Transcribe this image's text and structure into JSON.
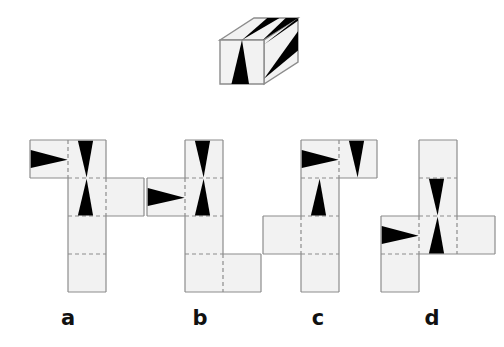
{
  "figure": {
    "type": "cube-net-puzzle",
    "background_color": "#ffffff",
    "face_fill": "#f2f2f2",
    "pattern_color": "#000000",
    "edge_color": "#8c8c8c",
    "fold_line_style": "dashed"
  },
  "cube": {
    "name": "patterned-cube",
    "faces": [
      {
        "id": "front",
        "marks": [
          "black-triangle-apex-up"
        ]
      },
      {
        "id": "top",
        "marks": [
          "black-triangle-left",
          "black-triangle-right"
        ]
      },
      {
        "id": "right",
        "marks": [
          "black-triangle-pointing-down-left"
        ]
      }
    ]
  },
  "options": [
    {
      "id": "a",
      "label": "a",
      "label_x": 68,
      "label_y": 306,
      "origin_x": 30,
      "origin_y": 140,
      "cell": 38,
      "cells": [
        {
          "col": 0,
          "row": 0,
          "marks": [
            "triangle-right"
          ]
        },
        {
          "col": 1,
          "row": 0,
          "marks": [
            "triangle-apex-down"
          ]
        },
        {
          "col": 1,
          "row": 1,
          "marks": [
            "triangle-apex-up"
          ]
        },
        {
          "col": 2,
          "row": 1,
          "marks": []
        },
        {
          "col": 1,
          "row": 2,
          "marks": []
        },
        {
          "col": 1,
          "row": 3,
          "marks": []
        }
      ]
    },
    {
      "id": "b",
      "label": "b",
      "label_x": 200,
      "label_y": 306,
      "origin_x": 147,
      "origin_y": 140,
      "cell": 38,
      "cells": [
        {
          "col": 1,
          "row": 0,
          "marks": [
            "triangle-apex-down"
          ]
        },
        {
          "col": 0,
          "row": 1,
          "marks": [
            "triangle-right"
          ]
        },
        {
          "col": 1,
          "row": 1,
          "marks": [
            "triangle-apex-up"
          ]
        },
        {
          "col": 1,
          "row": 2,
          "marks": []
        },
        {
          "col": 1,
          "row": 3,
          "marks": []
        },
        {
          "col": 2,
          "row": 3,
          "marks": []
        }
      ]
    },
    {
      "id": "c",
      "label": "c",
      "label_x": 318,
      "label_y": 306,
      "origin_x": 263,
      "origin_y": 140,
      "cell": 38,
      "cells": [
        {
          "col": 1,
          "row": 0,
          "marks": [
            "triangle-right"
          ]
        },
        {
          "col": 2,
          "row": 0,
          "marks": [
            "triangle-apex-down"
          ]
        },
        {
          "col": 1,
          "row": 1,
          "marks": [
            "triangle-apex-up"
          ]
        },
        {
          "col": 0,
          "row": 2,
          "marks": []
        },
        {
          "col": 1,
          "row": 2,
          "marks": []
        },
        {
          "col": 1,
          "row": 3,
          "marks": []
        }
      ]
    },
    {
      "id": "d",
      "label": "d",
      "label_x": 432,
      "label_y": 306,
      "origin_x": 381,
      "origin_y": 140,
      "cell": 38,
      "cells": [
        {
          "col": 1,
          "row": 0,
          "marks": []
        },
        {
          "col": 1,
          "row": 1,
          "marks": [
            "triangle-apex-down"
          ]
        },
        {
          "col": 0,
          "row": 2,
          "marks": [
            "triangle-right"
          ]
        },
        {
          "col": 1,
          "row": 2,
          "marks": [
            "triangle-apex-up"
          ]
        },
        {
          "col": 2,
          "row": 2,
          "marks": []
        },
        {
          "col": 0,
          "row": 3,
          "marks": []
        }
      ]
    }
  ]
}
